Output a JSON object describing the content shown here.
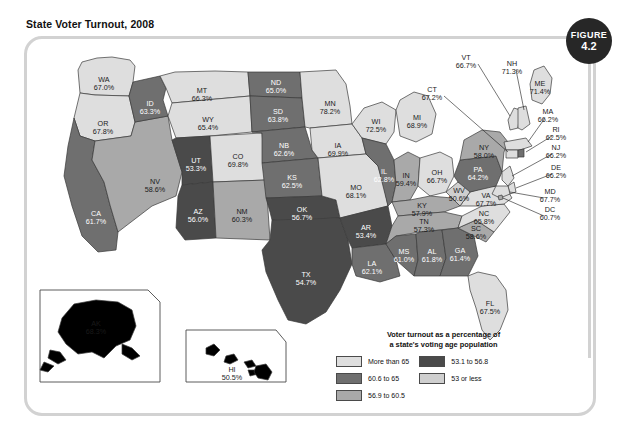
{
  "figure": {
    "title": "State Voter Turnout, 2008",
    "badge_word": "FIGURE",
    "badge_number": "4.2"
  },
  "legend": {
    "title_line1": "Voter turnout as a percentage of",
    "title_line2": "a state's voting age population",
    "col1": [
      {
        "label": "More than 65",
        "color": "#dedede"
      },
      {
        "label": "60.6 to 65",
        "color": "#6f6f6f"
      },
      {
        "label": "56.9 to 60.5",
        "color": "#a9a9a9"
      }
    ],
    "col2": [
      {
        "label": "53.1 to 56.8",
        "color": "#4a4a4a"
      },
      {
        "label": "53 or less",
        "color": "#cfcfcf"
      }
    ]
  },
  "colors": {
    "more_than_65": "#dedede",
    "c60_6_to_65": "#6f6f6f",
    "c56_9_to_60_5": "#a9a9a9",
    "c53_1_to_56_8": "#4a4a4a",
    "c53_or_less": "#cfcfcf",
    "frame": "#d2d2d2",
    "badge": "#272727",
    "outline": "#3a3a3a"
  },
  "chart_data": {
    "type": "map",
    "title": "State Voter Turnout, 2008",
    "units": "percent of voting age population",
    "legend_bins": [
      "More than 65",
      "60.6 to 65",
      "56.9 to 60.5",
      "53.1 to 56.8",
      "53 or less"
    ],
    "states": [
      {
        "code": "WA",
        "value": "67.0%",
        "bin": "More than 65"
      },
      {
        "code": "OR",
        "value": "67.8%",
        "bin": "More than 65"
      },
      {
        "code": "ID",
        "value": "63.3%",
        "bin": "60.6 to 65"
      },
      {
        "code": "MT",
        "value": "66.3%",
        "bin": "More than 65"
      },
      {
        "code": "WY",
        "value": "65.4%",
        "bin": "More than 65"
      },
      {
        "code": "ND",
        "value": "65.0%",
        "bin": "60.6 to 65"
      },
      {
        "code": "SD",
        "value": "63.8%",
        "bin": "60.6 to 65"
      },
      {
        "code": "NB",
        "value": "62.6%",
        "bin": "60.6 to 65"
      },
      {
        "code": "MN",
        "value": "78.2%",
        "bin": "More than 65"
      },
      {
        "code": "WI",
        "value": "72.5%",
        "bin": "More than 65"
      },
      {
        "code": "IA",
        "value": "69.9%",
        "bin": "More than 65"
      },
      {
        "code": "MI",
        "value": "68.9%",
        "bin": "More than 65"
      },
      {
        "code": "IL",
        "value": "62.8%",
        "bin": "60.6 to 65"
      },
      {
        "code": "IN",
        "value": "59.4%",
        "bin": "56.9 to 60.5"
      },
      {
        "code": "OH",
        "value": "66.7%",
        "bin": "More than 65"
      },
      {
        "code": "MO",
        "value": "68.1%",
        "bin": "More than 65"
      },
      {
        "code": "KS",
        "value": "62.5%",
        "bin": "60.6 to 65"
      },
      {
        "code": "CO",
        "value": "69.8%",
        "bin": "More than 65"
      },
      {
        "code": "UT",
        "value": "53.3%",
        "bin": "53.1 to 56.8"
      },
      {
        "code": "NV",
        "value": "58.6%",
        "bin": "56.9 to 60.5"
      },
      {
        "code": "CA",
        "value": "61.7%",
        "bin": "60.6 to 65"
      },
      {
        "code": "AZ",
        "value": "56.0%",
        "bin": "53.1 to 56.8"
      },
      {
        "code": "NM",
        "value": "60.3%",
        "bin": "56.9 to 60.5"
      },
      {
        "code": "OK",
        "value": "56.7%",
        "bin": "53.1 to 56.8"
      },
      {
        "code": "TX",
        "value": "54.7%",
        "bin": "53.1 to 56.8"
      },
      {
        "code": "AR",
        "value": "53.4%",
        "bin": "53.1 to 56.8"
      },
      {
        "code": "LA",
        "value": "62.1%",
        "bin": "60.6 to 65"
      },
      {
        "code": "MS",
        "value": "61.0%",
        "bin": "60.6 to 65"
      },
      {
        "code": "AL",
        "value": "61.8%",
        "bin": "60.6 to 65"
      },
      {
        "code": "GA",
        "value": "61.4%",
        "bin": "60.6 to 65"
      },
      {
        "code": "TN",
        "value": "57.3%",
        "bin": "56.9 to 60.5"
      },
      {
        "code": "KY",
        "value": "57.9%",
        "bin": "56.9 to 60.5"
      },
      {
        "code": "WV",
        "value": "50.6%",
        "bin": "53 or less"
      },
      {
        "code": "VA",
        "value": "67.7%",
        "bin": "More than 65"
      },
      {
        "code": "NC",
        "value": "65.8%",
        "bin": "More than 65"
      },
      {
        "code": "SC",
        "value": "58.6%",
        "bin": "56.9 to 60.5"
      },
      {
        "code": "FL",
        "value": "67.5%",
        "bin": "More than 65"
      },
      {
        "code": "PA",
        "value": "64.2%",
        "bin": "60.6 to 65"
      },
      {
        "code": "NY",
        "value": "58.0%",
        "bin": "56.9 to 60.5"
      },
      {
        "code": "VT",
        "value": "66.7%",
        "bin": "More than 65"
      },
      {
        "code": "NH",
        "value": "71.3%",
        "bin": "More than 65"
      },
      {
        "code": "ME",
        "value": "71.4%",
        "bin": "More than 65"
      },
      {
        "code": "MA",
        "value": "66.2%",
        "bin": "More than 65"
      },
      {
        "code": "RI",
        "value": "62.5%",
        "bin": "60.6 to 65"
      },
      {
        "code": "CT",
        "value": "67.2%",
        "bin": "More than 65"
      },
      {
        "code": "NJ",
        "value": "66.2%",
        "bin": "More than 65"
      },
      {
        "code": "DE",
        "value": "66.2%",
        "bin": "More than 65"
      },
      {
        "code": "MD",
        "value": "67.7%",
        "bin": "More than 65"
      },
      {
        "code": "DC",
        "value": "60.7%",
        "bin": "56.9 to 60.5"
      },
      {
        "code": "AK",
        "value": "68.3%",
        "bin": "More than 65"
      },
      {
        "code": "HI",
        "value": "50.5%",
        "bin": "53 or less"
      }
    ]
  }
}
